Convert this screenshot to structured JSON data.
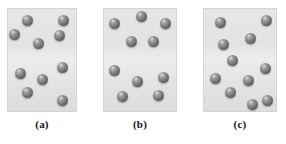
{
  "figure": {
    "background_color": "#ffffff",
    "panel_fill_color": "#e2e2e0",
    "panel_border_color": "#d3d3d1",
    "sphere_color": "#7d7d7d",
    "caption_color": "#141414",
    "panels": [
      {
        "id": "a",
        "label": "(a)",
        "box": {
          "x": 7,
          "y": 8,
          "width": 70,
          "height": 104
        },
        "sphere_count": 9,
        "spheres": [
          {
            "cx": 27,
            "cy": 20
          },
          {
            "cx": 63,
            "cy": 20
          },
          {
            "cx": 14,
            "cy": 34
          },
          {
            "cx": 59,
            "cy": 35
          },
          {
            "cx": 38,
            "cy": 43
          },
          {
            "cx": 62,
            "cy": 67
          },
          {
            "cx": 20,
            "cy": 73
          },
          {
            "cx": 42,
            "cy": 79
          },
          {
            "cx": 27,
            "cy": 92
          },
          {
            "cx": 62,
            "cy": 100
          }
        ]
      },
      {
        "id": "b",
        "label": "(b)",
        "box": {
          "x": 103,
          "y": 8,
          "width": 74,
          "height": 104
        },
        "sphere_count": 10,
        "spheres": [
          {
            "cx": 141,
            "cy": 16
          },
          {
            "cx": 114,
            "cy": 23
          },
          {
            "cx": 165,
            "cy": 23
          },
          {
            "cx": 131,
            "cy": 41
          },
          {
            "cx": 153,
            "cy": 41
          },
          {
            "cx": 114,
            "cy": 70
          },
          {
            "cx": 163,
            "cy": 77
          },
          {
            "cx": 137,
            "cy": 81
          },
          {
            "cx": 122,
            "cy": 96
          },
          {
            "cx": 158,
            "cy": 95
          }
        ]
      },
      {
        "id": "c",
        "label": "(c)",
        "box": {
          "x": 203,
          "y": 8,
          "width": 74,
          "height": 104
        },
        "sphere_count": 11,
        "spheres": [
          {
            "cx": 220,
            "cy": 22
          },
          {
            "cx": 266,
            "cy": 20
          },
          {
            "cx": 250,
            "cy": 38
          },
          {
            "cx": 223,
            "cy": 44
          },
          {
            "cx": 232,
            "cy": 60
          },
          {
            "cx": 265,
            "cy": 68
          },
          {
            "cx": 215,
            "cy": 78
          },
          {
            "cx": 248,
            "cy": 80
          },
          {
            "cx": 230,
            "cy": 92
          },
          {
            "cx": 267,
            "cy": 100
          },
          {
            "cx": 252,
            "cy": 104
          }
        ]
      }
    ],
    "captions": [
      {
        "text": "(a)",
        "center_x": 42
      },
      {
        "text": "(b)",
        "center_x": 140
      },
      {
        "text": "(c)",
        "center_x": 240
      }
    ]
  }
}
